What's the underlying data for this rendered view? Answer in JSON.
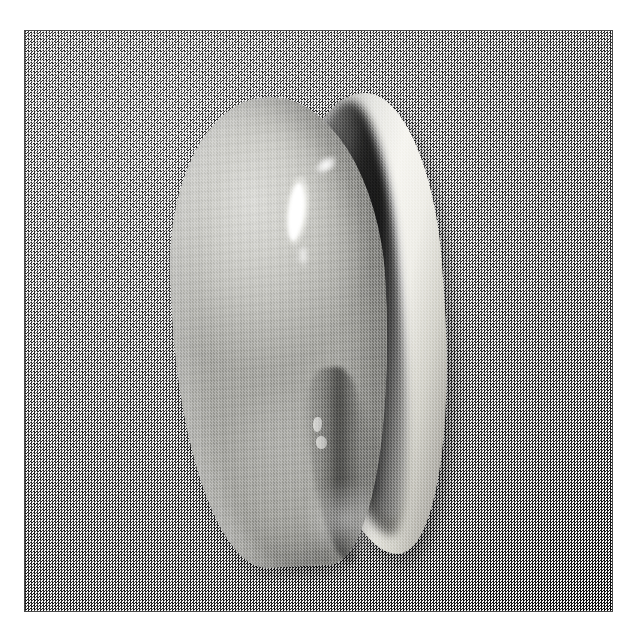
{
  "page": {
    "kind": "photograph",
    "orientation": "vertical",
    "color_mode": "grayscale",
    "canvas": {
      "width": 639,
      "height": 634,
      "background": "#ffffff"
    }
  },
  "photo": {
    "frame": {
      "left": 24,
      "top": 30,
      "width": 589,
      "height": 582,
      "border_color": "#4a4a4a",
      "border_width": 1
    },
    "background": {
      "name": "grainy-gray-backdrop",
      "base_color": "#9d9d9d",
      "texture": "fine-random-speckle",
      "light_direction": "upper-left"
    },
    "shadow": {
      "name": "cast-shadow",
      "color": "#000000",
      "opacity": 0.32,
      "direction": "lower-right"
    }
  },
  "shell": {
    "name": "cowrie-shell",
    "parts": {
      "dorsum": {
        "label": "dorsum",
        "base_color": "#c2c2bd",
        "highlight_color": "#dcdcd8",
        "shadow_color": "#8e8d89",
        "finish": "glossy"
      },
      "outer_lip": {
        "label": "outer-lip",
        "base_color": "#f6f5f0",
        "shadow_color": "#7d7b76"
      },
      "aperture_groove": {
        "label": "aperture-groove",
        "color": "#111111"
      },
      "aperture_slit": {
        "label": "aperture-slit",
        "color": "#2a2a2a"
      }
    },
    "highlights": [
      {
        "label": "primary-specular",
        "color": "#ffffff",
        "x": 259,
        "y": 144,
        "w": 26,
        "h": 78
      },
      {
        "label": "secondary-specular",
        "color": "#ffffff",
        "x": 288,
        "y": 126,
        "w": 26,
        "h": 16
      },
      {
        "label": "specular-tail",
        "color": "#ffffff",
        "x": 272,
        "y": 214,
        "w": 12,
        "h": 26
      }
    ],
    "speckles": [
      {
        "label": "callus-speck-upper",
        "color": "#f2f2ee",
        "x": 288,
        "y": 386
      },
      {
        "label": "callus-speck-lower",
        "color": "#f6f6f2",
        "x": 291,
        "y": 405
      }
    ],
    "bounds": {
      "left": 148,
      "top": 66,
      "right": 430,
      "bottom": 550
    }
  }
}
